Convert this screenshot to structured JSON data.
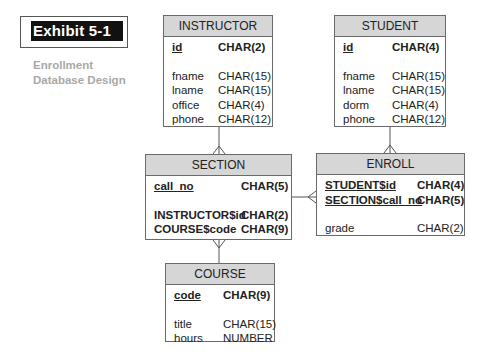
{
  "exhibit": {
    "label": "Exhibit 5-1",
    "caption_line1": "Enrollment",
    "caption_line2": "Database Design"
  },
  "entities": {
    "instructor": {
      "name": "INSTRUCTOR",
      "keys": [
        {
          "field": "id",
          "type": "CHAR(2)"
        }
      ],
      "attributes": [
        {
          "field": "fname",
          "type": "CHAR(15)"
        },
        {
          "field": "lname",
          "type": "CHAR(15)"
        },
        {
          "field": "office",
          "type": "CHAR(4)"
        },
        {
          "field": "phone",
          "type": "CHAR(12)"
        }
      ]
    },
    "student": {
      "name": "STUDENT",
      "keys": [
        {
          "field": "id",
          "type": "CHAR(4)"
        }
      ],
      "attributes": [
        {
          "field": "fname",
          "type": "CHAR(15)"
        },
        {
          "field": "lname",
          "type": "CHAR(15)"
        },
        {
          "field": "dorm",
          "type": "CHAR(4)"
        },
        {
          "field": "phone",
          "type": "CHAR(12)"
        }
      ]
    },
    "section": {
      "name": "SECTION",
      "keys": [
        {
          "field": "call_no",
          "type": "CHAR(5)"
        }
      ],
      "attributes": [
        {
          "field": "INSTRUCTOR$id",
          "type": "CHAR(2)"
        },
        {
          "field": "COURSE$code",
          "type": "CHAR(9)"
        }
      ]
    },
    "enroll": {
      "name": "ENROLL",
      "keys": [
        {
          "field": "STUDENT$id",
          "type": "CHAR(4)"
        },
        {
          "field": "SECTION$call_no",
          "type": "CHAR(5)"
        }
      ],
      "attributes": [
        {
          "field": "grade",
          "type": "CHAR(2)"
        }
      ]
    },
    "course": {
      "name": "COURSE",
      "keys": [
        {
          "field": "code",
          "type": "CHAR(9)"
        }
      ],
      "attributes": [
        {
          "field": "title",
          "type": "CHAR(15)"
        },
        {
          "field": "hours",
          "type": "NUMBER"
        }
      ]
    }
  },
  "relationships": [
    {
      "from": "INSTRUCTOR",
      "to": "SECTION",
      "cardinality": "one-to-many"
    },
    {
      "from": "STUDENT",
      "to": "ENROLL",
      "cardinality": "one-to-many"
    },
    {
      "from": "SECTION",
      "to": "ENROLL",
      "cardinality": "one-to-many"
    },
    {
      "from": "COURSE",
      "to": "SECTION",
      "cardinality": "one-to-many"
    }
  ]
}
